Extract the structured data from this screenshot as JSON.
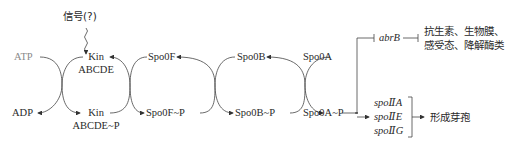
{
  "signal": "信号(?)",
  "nodes": {
    "atp": "ATP",
    "adp": "ADP",
    "kin_top_1": "Kin",
    "kin_top_2": "ABCDE",
    "kin_bot_1": "Kin",
    "kin_bot_2": "ABCDE~P",
    "spo0f": "Spo0F",
    "spo0f_p": "Spo0F~P",
    "spo0b": "Spo0B",
    "spo0b_p": "Spo0B~P",
    "spo0a": "Spo0A",
    "spo0a_p": "Spo0A~P"
  },
  "branches": {
    "abrb": "abrB",
    "abrb_targets_line1": "抗生素、生物膜、",
    "abrb_targets_line2": "感受态、降解酶类",
    "spo_genes": [
      "spoⅡA",
      "spoⅡE",
      "spoⅡG"
    ],
    "spo_outcome": "形成芽孢"
  },
  "colors": {
    "line": "#333333",
    "faded": "#8a8a8a"
  }
}
